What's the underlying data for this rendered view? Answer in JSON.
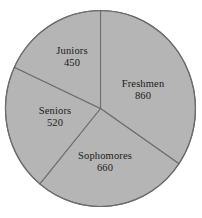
{
  "chart_data": {
    "type": "pie",
    "title": "",
    "subtitle": "",
    "xlabel": "",
    "ylabel": "",
    "legend_position": "none",
    "grid": false,
    "total": 2490,
    "start_angle_deg": 0,
    "direction": "clockwise",
    "categories": [
      "Freshmen",
      "Sophomores",
      "Seniors",
      "Juniors"
    ],
    "values": [
      860,
      660,
      520,
      450
    ],
    "slices": [
      {
        "label": "Freshmen",
        "value": "860",
        "value_number": 860,
        "percent": 34.5,
        "angle_deg": 124.3,
        "start_deg": 0,
        "end_deg": 124.3,
        "color": "#b5b5b5"
      },
      {
        "label": "Sophomores",
        "value": "660",
        "value_number": 660,
        "percent": 26.5,
        "angle_deg": 95.4,
        "start_deg": 124.3,
        "end_deg": 219.7,
        "color": "#b5b5b5"
      },
      {
        "label": "Seniors",
        "value": "520",
        "value_number": 520,
        "percent": 20.9,
        "angle_deg": 75.2,
        "start_deg": 219.7,
        "end_deg": 294.9,
        "color": "#b5b5b5"
      },
      {
        "label": "Juniors",
        "value": "450",
        "value_number": 450,
        "percent": 18.1,
        "angle_deg": 65.1,
        "start_deg": 294.9,
        "end_deg": 360,
        "color": "#b5b5b5"
      }
    ],
    "style": {
      "slice_fill": "#b5b5b5",
      "slice_border": "#6e6e6e",
      "background": "#ffffff",
      "label_color": "#1b1b1b"
    }
  }
}
